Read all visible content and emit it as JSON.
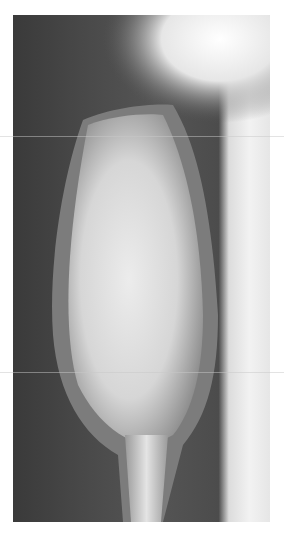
{
  "image": {
    "subject": "radiograph-of-long-bone-with-expansile-lesion",
    "colors": {
      "background": "#ffffff",
      "soft_tissue": "#4a4a4a",
      "bone": "#e8e8e8",
      "exposure_edge": "#f2f2f2"
    }
  }
}
